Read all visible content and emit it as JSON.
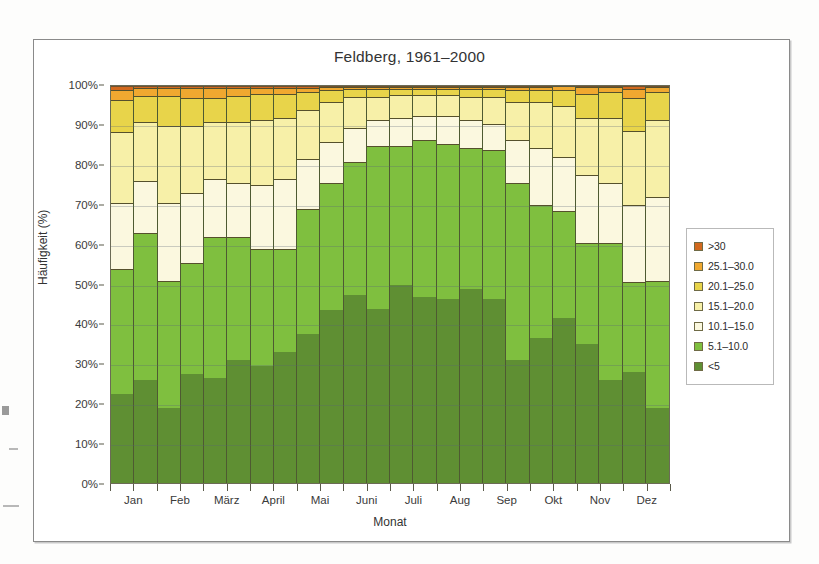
{
  "figure": {
    "title": "Feldberg, 1961–2000",
    "frame_visible": true
  },
  "axes": {
    "y_label": "Häufigkeit (%)",
    "x_label": "Monat",
    "y_ticks": [
      "0%",
      "10%",
      "20%",
      "30%",
      "40%",
      "50%",
      "60%",
      "70%",
      "80%",
      "90%",
      "100%"
    ],
    "x_ticks": [
      "Jan",
      "Feb",
      "März",
      "April",
      "Mai",
      "Juni",
      "Juli",
      "Aug",
      "Sep",
      "Okt",
      "Nov",
      "Dez"
    ]
  },
  "legend": {
    "position": "right",
    "items": [
      {
        "label": ">30",
        "color": "#d2691e"
      },
      {
        "label": "25.1–30.0",
        "color": "#f0a830"
      },
      {
        "label": "20.1–25.0",
        "color": "#e8d44a"
      },
      {
        "label": "15.1–20.0",
        "color": "#f7f0a8"
      },
      {
        "label": "10.1–15.0",
        "color": "#fbf8df"
      },
      {
        "label": "5.1–10.0",
        "color": "#7fbf3f"
      },
      {
        "label": "<5",
        "color": "#5f8f33"
      }
    ]
  },
  "chart_data": {
    "type": "bar",
    "stacked": true,
    "title": "Feldberg, 1961–2000",
    "xlabel": "Monat",
    "ylabel": "Häufigkeit (%)",
    "ylim": [
      0,
      100
    ],
    "grid": true,
    "legend_position": "right",
    "unit": "%",
    "note": "Stacked frequency distribution of wind speed classes per half-month period; 24 bars, 2 per month.",
    "categories": [
      "Jan a",
      "Jan b",
      "Feb a",
      "Feb b",
      "März a",
      "März b",
      "April a",
      "April b",
      "Mai a",
      "Mai b",
      "Juni a",
      "Juni b",
      "Juli a",
      "Juli b",
      "Aug a",
      "Aug b",
      "Sep a",
      "Sep b",
      "Okt a",
      "Okt b",
      "Nov a",
      "Nov b",
      "Dez a",
      "Dez b"
    ],
    "series": [
      {
        "name": "<5",
        "color": "#5f8f33",
        "values": [
          22.5,
          26.0,
          19.0,
          27.5,
          26.5,
          31.0,
          29.5,
          33.0,
          37.5,
          43.5,
          47.5,
          44.0,
          50.0,
          47.0,
          46.5,
          49.0,
          46.5,
          31.0,
          36.5,
          41.5,
          35.0,
          26.0,
          28.0,
          19.0
        ]
      },
      {
        "name": "5.1–10.0",
        "color": "#7fbf3f",
        "values": [
          31.5,
          37.0,
          32.0,
          28.0,
          35.5,
          31.0,
          29.5,
          26.0,
          31.5,
          32.0,
          33.5,
          41.0,
          35.0,
          39.5,
          39.0,
          35.5,
          37.5,
          44.5,
          33.5,
          27.0,
          25.5,
          34.5,
          23.0,
          32.0
        ]
      },
      {
        "name": "10.1–15.0",
        "color": "#fbf8df",
        "values": [
          16.5,
          13.0,
          19.5,
          17.5,
          14.5,
          13.5,
          16.0,
          17.5,
          12.5,
          10.5,
          8.5,
          6.5,
          7.0,
          6.0,
          7.0,
          7.0,
          6.5,
          11.0,
          14.5,
          13.5,
          17.0,
          15.0,
          19.5,
          21.0
        ]
      },
      {
        "name": "15.1–20.0",
        "color": "#f7f0a8",
        "values": [
          18.0,
          15.0,
          19.5,
          17.0,
          14.5,
          15.5,
          16.5,
          15.5,
          12.5,
          10.0,
          8.0,
          6.0,
          6.0,
          5.5,
          5.5,
          6.0,
          7.0,
          9.5,
          11.5,
          13.0,
          14.5,
          16.5,
          18.5,
          19.5
        ]
      },
      {
        "name": "20.1–25.0",
        "color": "#e8d44a",
        "values": [
          8.0,
          6.5,
          7.5,
          7.0,
          6.0,
          6.5,
          6.5,
          6.0,
          4.5,
          3.0,
          2.0,
          2.0,
          1.5,
          1.5,
          1.5,
          2.0,
          2.0,
          3.0,
          3.0,
          4.0,
          6.0,
          6.5,
          8.5,
          7.0
        ]
      },
      {
        "name": "25.1–30.0",
        "color": "#f0a830",
        "values": [
          2.5,
          2.0,
          2.0,
          2.5,
          2.5,
          2.0,
          1.5,
          1.5,
          1.0,
          0.8,
          0.4,
          0.4,
          0.4,
          0.4,
          0.4,
          0.4,
          0.4,
          0.8,
          0.8,
          1.0,
          1.8,
          1.3,
          2.3,
          1.3
        ]
      },
      {
        "name": ">30",
        "color": "#d2691e",
        "values": [
          1.0,
          0.5,
          0.5,
          0.5,
          0.5,
          0.5,
          0.5,
          0.5,
          0.5,
          0.2,
          0.1,
          0.1,
          0.1,
          0.1,
          0.1,
          0.1,
          0.1,
          0.2,
          0.2,
          0.0,
          0.2,
          0.2,
          0.7,
          0.2
        ]
      }
    ]
  }
}
